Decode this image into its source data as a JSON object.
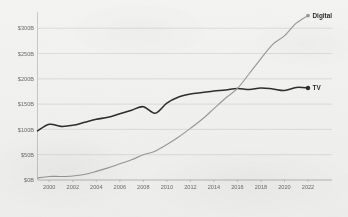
{
  "chart_data": {
    "type": "line",
    "title": "",
    "title_clipped_remnant": "",
    "xlabel": "",
    "ylabel": "",
    "x": [
      1999,
      2000,
      2001,
      2002,
      2003,
      2004,
      2005,
      2006,
      2007,
      2008,
      2009,
      2010,
      2011,
      2012,
      2013,
      2014,
      2015,
      2016,
      2017,
      2018,
      2019,
      2020,
      2021,
      2022
    ],
    "xlim": [
      1999,
      2022
    ],
    "ylim": [
      0,
      340
    ],
    "xtick_labels": [
      "2000",
      "2002",
      "2004",
      "2006",
      "2008",
      "2010",
      "2012",
      "2014",
      "2016",
      "2018",
      "2020",
      "2022"
    ],
    "xtick_values": [
      2000,
      2002,
      2004,
      2006,
      2008,
      2010,
      2012,
      2014,
      2016,
      2018,
      2020,
      2022
    ],
    "ytick_labels": [
      "$0B",
      "$50B",
      "$100B",
      "$150B",
      "$200B",
      "$250B",
      "$300B"
    ],
    "ytick_values": [
      0,
      50,
      100,
      150,
      200,
      250,
      300
    ],
    "grid": "horizontal",
    "legend_position": "end-of-line",
    "series": [
      {
        "name": "TV",
        "label": "TV",
        "color": "#2e2e2e",
        "marker": "dot",
        "values": [
          97,
          110,
          106,
          108,
          114,
          120,
          124,
          131,
          138,
          145,
          132,
          152,
          164,
          170,
          173,
          176,
          178,
          181,
          179,
          182,
          180,
          177,
          183,
          182
        ]
      },
      {
        "name": "Digital",
        "label": "Digital",
        "color": "#9a9a9a",
        "marker": "dot",
        "values": [
          4,
          7,
          7,
          8,
          11,
          17,
          24,
          32,
          40,
          50,
          57,
          70,
          85,
          102,
          120,
          141,
          162,
          181,
          210,
          240,
          268,
          285,
          310,
          325
        ]
      }
    ]
  },
  "axes": {
    "y_axis_name": "y-axis",
    "x_axis_name": "x-axis"
  }
}
